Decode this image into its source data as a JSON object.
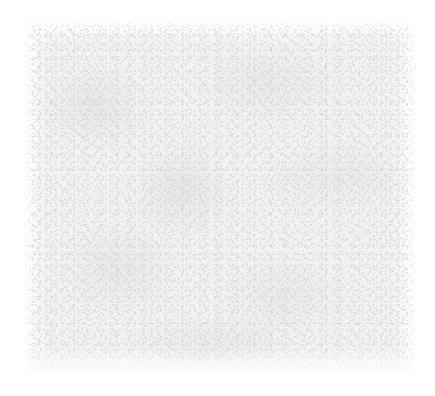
{
  "page": {
    "title": "",
    "body_text": "",
    "visible_text": "",
    "content_note": ""
  },
  "canvas": {
    "width": 435,
    "height": 396,
    "background_color": "#ffffff"
  },
  "scan_region": {
    "label": "",
    "x": 25,
    "y": 22,
    "width": 390,
    "height": 352,
    "fill_color": "#f2f2f2",
    "grain_color": "#cccccc",
    "mottle_color": "#dedede",
    "edge_style": "feathered"
  }
}
